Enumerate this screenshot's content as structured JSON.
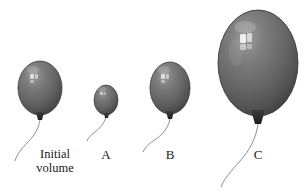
{
  "figure": {
    "background_color": "#ffffff",
    "width": 307,
    "height": 194
  },
  "palette": {
    "balloon_light": "#9a9a9a",
    "balloon_mid": "#6e6e6e",
    "balloon_dark": "#4a4a4a",
    "balloon_edge": "#3a3a3a",
    "highlight": "#f2f2f2",
    "string": "#8a8a8a",
    "knot": "#2e2e2e",
    "text": "#1a1a1a"
  },
  "labels": {
    "initial": {
      "line1": "Initial",
      "line2": "volume"
    },
    "a": "A",
    "b": "B",
    "c": "C"
  },
  "balloons": [
    {
      "id": "initial",
      "label": "Initial volume",
      "center_x": 40,
      "center_y": 88,
      "radius_x": 22,
      "radius_y": 27,
      "size_rank": 3
    },
    {
      "id": "a",
      "label": "A",
      "center_x": 106,
      "center_y": 100,
      "radius_x": 12,
      "radius_y": 15,
      "size_rank": 1
    },
    {
      "id": "b",
      "label": "B",
      "center_x": 170,
      "center_y": 88,
      "radius_x": 20,
      "radius_y": 26,
      "size_rank": 2
    },
    {
      "id": "c",
      "label": "C",
      "center_x": 258,
      "center_y": 63,
      "radius_x": 40,
      "radius_y": 53,
      "size_rank": 4
    }
  ]
}
